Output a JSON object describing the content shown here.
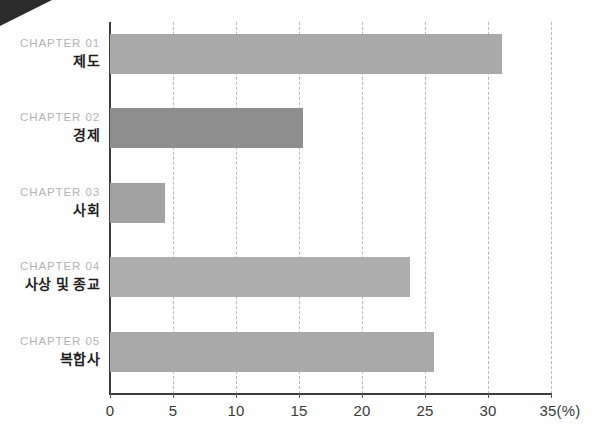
{
  "chart_data": {
    "type": "bar",
    "orientation": "horizontal",
    "title": "",
    "xlabel": "(%)",
    "ylabel": "",
    "xlim": [
      0,
      35
    ],
    "xticks": [
      0,
      5,
      10,
      15,
      20,
      25,
      30,
      35
    ],
    "xtick_labels": [
      "0",
      "5",
      "10",
      "15",
      "20",
      "25",
      "30",
      "35(%)"
    ],
    "grid": "vertical-dashed",
    "legend": "none",
    "categories": [
      "제도",
      "경제",
      "사회",
      "사상 및 종교",
      "복합사"
    ],
    "category_prefixes": [
      "CHAPTER 01",
      "CHAPTER 02",
      "CHAPTER 03",
      "CHAPTER 04",
      "CHAPTER 05"
    ],
    "values": [
      31.1,
      15.3,
      4.4,
      23.8,
      25.7
    ],
    "bar_colors": [
      "#a9a9a9",
      "#8e8e8e",
      "#a2a2a2",
      "#aeaeae",
      "#a9a9a9"
    ],
    "series": [
      {
        "name": "비중",
        "values": [
          31.1,
          15.3,
          4.4,
          23.8,
          25.7
        ]
      }
    ]
  },
  "colors": {
    "bar_default": "#a9a9a9",
    "bar_dark": "#8e8e8e",
    "axis": "#3b3b3b",
    "gridline": "#b9b9b9",
    "chapter_text": "#b3b3b3",
    "title_text": "#1f1f1f",
    "corner_wedge": "#2b2b2b"
  },
  "rows": [
    {
      "chapter": "CHAPTER 01",
      "title": "제도",
      "value": 31.1
    },
    {
      "chapter": "CHAPTER 02",
      "title": "경제",
      "value": 15.3
    },
    {
      "chapter": "CHAPTER 03",
      "title": "사회",
      "value": 4.4
    },
    {
      "chapter": "CHAPTER 04",
      "title": "사상 및 종교",
      "value": 23.8
    },
    {
      "chapter": "CHAPTER 05",
      "title": "복합사",
      "value": 25.7
    }
  ],
  "axis": {
    "unit_label": "(%)",
    "ticks": [
      "0",
      "5",
      "10",
      "15",
      "20",
      "25",
      "30",
      "35(%)"
    ]
  }
}
